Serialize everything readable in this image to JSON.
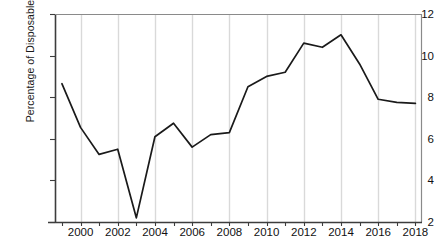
{
  "chart_data": {
    "type": "line",
    "title": "",
    "xlabel": "",
    "ylabel": "Percentage of Disposable Income",
    "xlim": [
      1999,
      2018
    ],
    "ylim": [
      2,
      12
    ],
    "yticks": [
      2,
      4,
      6,
      8,
      10,
      12
    ],
    "xticks": [
      2000,
      2002,
      2004,
      2006,
      2008,
      2010,
      2012,
      2014,
      2016,
      2018
    ],
    "xtick_labels": [
      "2000",
      "2002",
      "2004",
      "2006",
      "2008",
      "2010",
      "2012",
      "2014",
      "2016",
      "2018"
    ],
    "ytick_labels": [
      "2",
      "4",
      "6",
      "8",
      "10",
      "12"
    ],
    "grid": "vertical",
    "legend": null,
    "line_color": "#1a1a1a",
    "grid_color": "#d9d9d9",
    "axis_color": "#4d4d4d",
    "x": [
      1999,
      2000,
      2001,
      2002,
      2003,
      2004,
      2005,
      2006,
      2007,
      2008,
      2009,
      2010,
      2011,
      2012,
      2013,
      2014,
      2015,
      2016,
      2017,
      2018
    ],
    "values": [
      8.65,
      6.55,
      5.25,
      5.5,
      2.2,
      6.1,
      6.75,
      5.6,
      6.2,
      6.3,
      8.5,
      9.0,
      9.2,
      10.6,
      10.4,
      11.0,
      9.6,
      7.9,
      7.75,
      7.7
    ],
    "series": [
      {
        "name": "Percentage of Disposable Income",
        "values": [
          8.65,
          6.55,
          5.25,
          5.5,
          2.2,
          6.1,
          6.75,
          5.6,
          6.2,
          6.3,
          8.5,
          9.0,
          9.2,
          10.6,
          10.4,
          11.0,
          9.6,
          7.9,
          7.75,
          7.7
        ]
      }
    ]
  }
}
